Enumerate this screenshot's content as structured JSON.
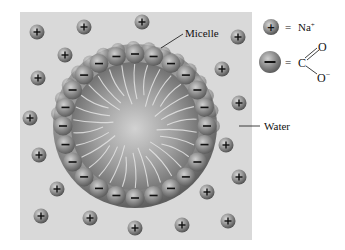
{
  "diagram": {
    "background_color": "#d9d9d9",
    "labels": {
      "micelle": "Micelle",
      "water": "Water"
    },
    "legend": {
      "sodium": {
        "symbol": "+",
        "equals": "=",
        "text": "Na",
        "superscript": "+"
      },
      "carboxylate": {
        "symbol": "−",
        "equals": "=",
        "carbon": "C",
        "oxygen_double": "O",
        "oxygen_single": "O",
        "oxygen_charge": "−"
      }
    },
    "colors": {
      "ion_light": "#bdbdbd",
      "ion_dark": "#4a4a4a",
      "core_light": "#d0d0d0",
      "core_dark": "#6e6e6e",
      "text": "#111111"
    },
    "sodium_ions": [
      {
        "x": 37,
        "y": 32
      },
      {
        "x": 84,
        "y": 27
      },
      {
        "x": 142,
        "y": 22
      },
      {
        "x": 65,
        "y": 55
      },
      {
        "x": 238,
        "y": 37
      },
      {
        "x": 222,
        "y": 69
      },
      {
        "x": 38,
        "y": 78
      },
      {
        "x": 239,
        "y": 103
      },
      {
        "x": 30,
        "y": 118
      },
      {
        "x": 39,
        "y": 155
      },
      {
        "x": 226,
        "y": 145
      },
      {
        "x": 239,
        "y": 177
      },
      {
        "x": 57,
        "y": 189
      },
      {
        "x": 207,
        "y": 192
      },
      {
        "x": 41,
        "y": 216
      },
      {
        "x": 90,
        "y": 218
      },
      {
        "x": 135,
        "y": 228
      },
      {
        "x": 182,
        "y": 225
      },
      {
        "x": 228,
        "y": 221
      }
    ],
    "micelle": {
      "cx": 135,
      "cy": 126,
      "outer_r": 82,
      "core_r": 66,
      "head_ring_r": 72,
      "head_count": 24,
      "tail_count": 30
    }
  }
}
